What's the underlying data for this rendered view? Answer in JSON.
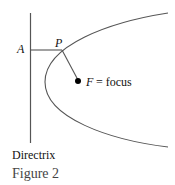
{
  "figure": {
    "caption": "Figure 2",
    "labels": {
      "point_a": "A",
      "point_p": "P",
      "focus_f": "F",
      "focus_eq": "= focus",
      "directrix": "Directrix"
    },
    "colors": {
      "line": "#555555",
      "text": "#111111",
      "caption": "#444444"
    }
  }
}
